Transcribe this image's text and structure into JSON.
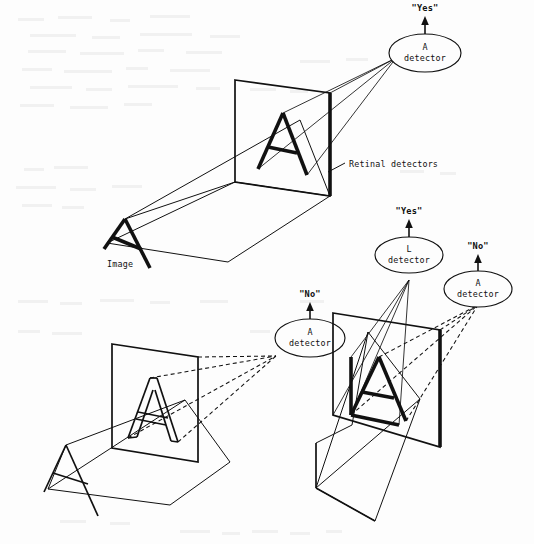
{
  "figure": {
    "background_color": "#fdfdfd",
    "ink_color": "#111111",
    "panels": [
      {
        "id": "top",
        "name": "upright-A-recognized",
        "source_label": "Image",
        "plane_label": "Retinal detectors",
        "letter_on_retina": "A",
        "letter_style": "solid-bold",
        "ray_style": "solid",
        "detectors": [
          {
            "id": "a-detector-top",
            "line1": "A",
            "line2": "detector",
            "response": "\"Yes\""
          }
        ]
      },
      {
        "id": "bottom-left",
        "name": "outlined-A-not-recognized",
        "source_label": "",
        "plane_label": "",
        "letter_on_retina": "A",
        "letter_style": "outline",
        "ray_style": "dashed",
        "detectors": [
          {
            "id": "a-detector-bl",
            "line1": "A",
            "line2": "detector",
            "response": "\"No\""
          }
        ]
      },
      {
        "id": "bottom-right",
        "name": "LA-ligature-L-recognized",
        "source_label": "",
        "plane_label": "",
        "letter_on_retina": "LA",
        "letter_style": "solid-bold",
        "ray_style": "mixed",
        "detectors": [
          {
            "id": "l-detector-br",
            "line1": "L",
            "line2": "detector",
            "response": "\"Yes\""
          },
          {
            "id": "a-detector-br",
            "line1": "A",
            "line2": "detector",
            "response": "\"No\""
          }
        ]
      }
    ],
    "labels": {
      "image": "Image",
      "retinal_detectors": "Retinal detectors",
      "yes": "\"Yes\"",
      "no": "\"No\"",
      "detector_word": "detector",
      "letter_a": "A",
      "letter_l": "L"
    }
  }
}
